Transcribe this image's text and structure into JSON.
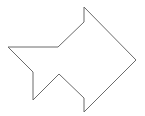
{
  "diagram": {
    "type": "polygon-outline",
    "stroke_color": "#6b6b6b",
    "fill_color": "#ffffff",
    "stroke_width": 1,
    "points": [
      [
        84,
        7
      ],
      [
        136,
        60
      ],
      [
        84,
        112
      ],
      [
        84,
        98
      ],
      [
        59,
        74
      ],
      [
        33,
        100
      ],
      [
        33,
        72
      ],
      [
        8,
        47
      ],
      [
        58,
        47
      ],
      [
        84,
        22
      ]
    ]
  }
}
